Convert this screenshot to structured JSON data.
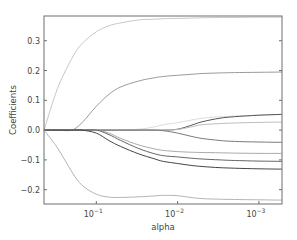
{
  "chart_data": {
    "type": "line",
    "title": "",
    "xlabel": "alpha",
    "ylabel": "Coefficients",
    "xscale": "log",
    "x_reversed": true,
    "xlim": [
      0.44,
      0.00052
    ],
    "ylim": [
      -0.248,
      0.383
    ],
    "grid": false,
    "legend": null,
    "xticks": [
      {
        "value": 0.1,
        "label_base": "10",
        "label_exp": "−1"
      },
      {
        "value": 0.01,
        "label_base": "10",
        "label_exp": "−2"
      },
      {
        "value": 0.001,
        "label_base": "10",
        "label_exp": "−3"
      }
    ],
    "yticks": [
      {
        "value": 0.3,
        "label": "0.3"
      },
      {
        "value": 0.2,
        "label": "0.2"
      },
      {
        "value": 0.1,
        "label": "0.1"
      },
      {
        "value": 0.0,
        "label": "0.0"
      },
      {
        "value": -0.1,
        "label": "−0.1"
      },
      {
        "value": -0.2,
        "label": "−0.2"
      }
    ],
    "x": [
      0.44,
      0.3,
      0.2,
      0.15,
      0.1,
      0.07,
      0.05,
      0.03,
      0.02,
      0.015,
      0.01,
      0.007,
      0.005,
      0.003,
      0.002,
      0.001,
      0.00052
    ],
    "series": [
      {
        "name": "coef_1",
        "color": "#c8c8c8",
        "values": [
          0.0,
          0.14,
          0.24,
          0.29,
          0.33,
          0.35,
          0.36,
          0.37,
          0.372,
          0.374,
          0.375,
          0.376,
          0.377,
          0.378,
          0.378,
          0.379,
          0.379
        ]
      },
      {
        "name": "coef_2",
        "color": "#9a9a9a",
        "values": [
          0.0,
          0.0,
          0.0,
          0.025,
          0.08,
          0.12,
          0.145,
          0.165,
          0.175,
          0.18,
          0.184,
          0.187,
          0.19,
          0.192,
          0.193,
          0.194,
          0.195
        ]
      },
      {
        "name": "coef_3",
        "color": "#dcdcdc",
        "values": [
          0.0,
          0.0,
          0.0,
          0.0,
          0.0,
          0.0,
          0.0,
          0.003,
          0.01,
          0.018,
          0.025,
          0.033,
          0.04,
          0.045,
          0.047,
          0.05,
          0.052
        ]
      },
      {
        "name": "coef_4",
        "color": "#555555",
        "values": [
          0.0,
          0.0,
          0.0,
          0.0,
          0.0,
          0.0,
          0.0,
          0.0,
          0.0,
          0.0,
          0.003,
          0.015,
          0.028,
          0.04,
          0.045,
          0.05,
          0.053
        ]
      },
      {
        "name": "coef_5",
        "color": "#bdbdbd",
        "values": [
          0.0,
          0.0,
          0.0,
          0.0,
          0.0,
          0.0,
          0.0,
          0.0,
          0.0,
          0.0,
          0.002,
          0.01,
          0.018,
          0.022,
          0.024,
          0.026,
          0.027
        ]
      },
      {
        "name": "coef_6",
        "color": "#7a7a7a",
        "values": [
          0.0,
          0.0,
          0.0,
          0.0,
          0.0,
          0.0,
          0.0,
          0.0,
          0.0,
          -0.002,
          -0.01,
          -0.02,
          -0.028,
          -0.035,
          -0.038,
          -0.04,
          -0.041
        ]
      },
      {
        "name": "coef_7",
        "color": "#aaaaaa",
        "values": [
          0.0,
          0.0,
          0.0,
          0.0,
          0.0,
          -0.01,
          -0.028,
          -0.05,
          -0.062,
          -0.068,
          -0.072,
          -0.074,
          -0.075,
          -0.076,
          -0.077,
          -0.078,
          -0.078
        ]
      },
      {
        "name": "coef_8",
        "color": "#666666",
        "values": [
          0.0,
          0.0,
          0.0,
          0.0,
          0.0,
          -0.015,
          -0.035,
          -0.062,
          -0.078,
          -0.086,
          -0.09,
          -0.094,
          -0.097,
          -0.1,
          -0.102,
          -0.104,
          -0.105
        ]
      },
      {
        "name": "coef_9",
        "color": "#444444",
        "values": [
          0.0,
          0.0,
          0.0,
          0.0,
          -0.01,
          -0.035,
          -0.055,
          -0.08,
          -0.095,
          -0.105,
          -0.112,
          -0.118,
          -0.122,
          -0.126,
          -0.128,
          -0.13,
          -0.131
        ]
      },
      {
        "name": "coef_10",
        "color": "#b5b5b5",
        "values": [
          0.0,
          -0.06,
          -0.14,
          -0.185,
          -0.215,
          -0.225,
          -0.226,
          -0.224,
          -0.221,
          -0.219,
          -0.22,
          -0.226,
          -0.23,
          -0.232,
          -0.233,
          -0.234,
          -0.235
        ]
      }
    ]
  },
  "axes": {
    "xlabel": "alpha",
    "ylabel": "Coefficients"
  }
}
